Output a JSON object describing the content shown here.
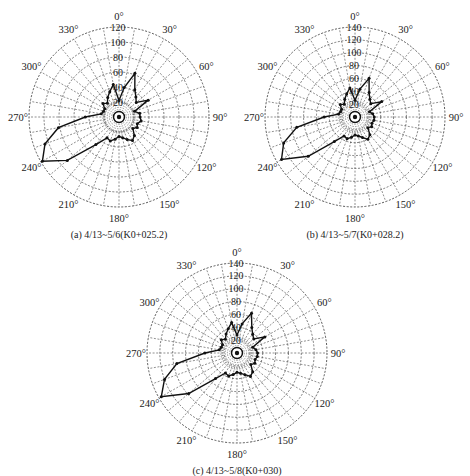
{
  "chart_data": [
    {
      "type": "polar-line",
      "id": "a",
      "caption": "(a)  4/13~5/6(K0+025.2)",
      "center": [
        119,
        117
      ],
      "radius_px": 90,
      "rmax": 120,
      "rticks": [
        20,
        40,
        60,
        80,
        100,
        120
      ],
      "angle_ticks": [
        0,
        30,
        60,
        90,
        120,
        150,
        180,
        210,
        240,
        270,
        300,
        330
      ],
      "angle_labels": [
        "0°",
        "30°",
        "60°",
        "90°",
        "120°",
        "150°",
        "180°",
        "210°",
        "240°",
        "270°",
        "300°",
        "330°"
      ],
      "theta_deg": [
        0,
        10,
        20,
        30,
        40,
        50,
        60,
        70,
        80,
        90,
        100,
        110,
        120,
        130,
        140,
        150,
        160,
        170,
        180,
        190,
        200,
        210,
        220,
        230,
        240,
        250,
        260,
        270,
        280,
        290,
        300,
        310,
        320,
        330,
        340,
        350
      ],
      "values": [
        22,
        40,
        62,
        42,
        35,
        30,
        45,
        22,
        28,
        28,
        30,
        26,
        28,
        24,
        32,
        36,
        32,
        28,
        26,
        30,
        34,
        32,
        48,
        90,
        118,
        105,
        82,
        45,
        24,
        22,
        22,
        28,
        24,
        30,
        36,
        44
      ]
    },
    {
      "type": "polar-line",
      "id": "b",
      "caption": "(b)  4/13~5/7(K0+028.2)",
      "center": [
        355,
        117
      ],
      "radius_px": 90,
      "rmax": 140,
      "rticks": [
        20,
        40,
        60,
        80,
        100,
        120,
        140
      ],
      "angle_ticks": [
        0,
        30,
        60,
        90,
        120,
        150,
        180,
        210,
        240,
        270,
        300,
        330
      ],
      "angle_labels": [
        "0°",
        "30°",
        "60°",
        "90°",
        "120°",
        "150°",
        "180°",
        "210°",
        "240°",
        "270°",
        "300°",
        "330°"
      ],
      "theta_deg": [
        0,
        10,
        20,
        30,
        40,
        50,
        60,
        70,
        80,
        90,
        100,
        110,
        120,
        130,
        140,
        150,
        160,
        170,
        180,
        190,
        200,
        210,
        220,
        230,
        240,
        250,
        260,
        270,
        280,
        290,
        300,
        310,
        320,
        330,
        340,
        350
      ],
      "values": [
        26,
        44,
        64,
        44,
        36,
        32,
        48,
        24,
        28,
        30,
        30,
        28,
        30,
        26,
        36,
        40,
        34,
        30,
        28,
        32,
        36,
        34,
        50,
        95,
        132,
        118,
        92,
        48,
        26,
        24,
        24,
        30,
        26,
        32,
        38,
        46
      ]
    },
    {
      "type": "polar-line",
      "id": "c",
      "caption": "(c)  4/13~5/8(K0+030)",
      "center": [
        237,
        353
      ],
      "radius_px": 90,
      "rmax": 140,
      "rticks": [
        20,
        40,
        60,
        80,
        100,
        120,
        140
      ],
      "angle_ticks": [
        0,
        30,
        60,
        90,
        120,
        150,
        180,
        210,
        240,
        270,
        300,
        330
      ],
      "angle_labels": [
        "0°",
        "30°",
        "60°",
        "90°",
        "120°",
        "150°",
        "180°",
        "210°",
        "240°",
        "270°",
        "300°",
        "330°"
      ],
      "theta_deg": [
        0,
        10,
        20,
        30,
        40,
        50,
        60,
        70,
        80,
        90,
        100,
        110,
        120,
        130,
        140,
        150,
        160,
        170,
        180,
        190,
        200,
        210,
        220,
        230,
        240,
        250,
        260,
        270,
        280,
        290,
        300,
        310,
        320,
        330,
        340,
        350
      ],
      "values": [
        28,
        46,
        66,
        46,
        38,
        34,
        50,
        26,
        30,
        32,
        32,
        30,
        32,
        28,
        38,
        42,
        36,
        32,
        30,
        34,
        38,
        36,
        52,
        98,
        136,
        120,
        95,
        50,
        28,
        26,
        26,
        32,
        28,
        34,
        40,
        48
      ]
    }
  ]
}
